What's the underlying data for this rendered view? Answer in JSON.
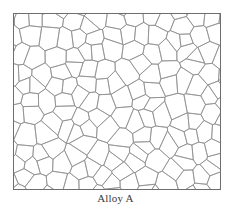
{
  "figure": {
    "caption": "Alloy A",
    "frame": {
      "x": 13,
      "y": 13,
      "width": 208,
      "height": 177
    },
    "colors": {
      "background": "#ffffff",
      "frame_stroke": "#6e6e6e",
      "grain_boundary": "#8a8a8a",
      "caption_text": "#3a3a3a"
    },
    "grains": {
      "description": "polygonal equiaxed grain structure (grain boundaries)",
      "approx_columns": 13,
      "approx_rows": 11,
      "approx_grain_size_px": 16,
      "jitter": 0.42,
      "seed": 7
    }
  }
}
